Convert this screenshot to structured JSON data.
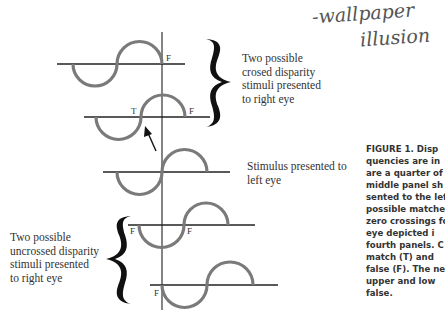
{
  "handwriting": {
    "line1": "-wallpaper",
    "line2": "illusion"
  },
  "labels": {
    "crossed": "Two possible\ncrosed disparity\nstimuli presented\nto right eye",
    "left_eye": "Stimulus presented to\nleft eye",
    "uncrossed": "Two possible\nuncrossed disparity\nstimuli presented\nto right eye"
  },
  "markers": {
    "panel1_right": "F",
    "panel2_left": "T",
    "panel2_right": "F",
    "panel4_left": "F",
    "panel4_right": "F",
    "panel5_left": "F"
  },
  "caption": {
    "lines": [
      "FIGURE 1. Disp",
      "quencies are in",
      "are a quarter of",
      "middle panel sh",
      "sented to the lef",
      "possible matches",
      "zero crossings fo",
      "eye depicted i",
      "fourth panels. C",
      "match (T) and",
      "false (F). The ne",
      "upper and low",
      "false."
    ]
  },
  "colors": {
    "wave": "#7a7a7a",
    "axis": "#222222",
    "brace": "#111111"
  }
}
